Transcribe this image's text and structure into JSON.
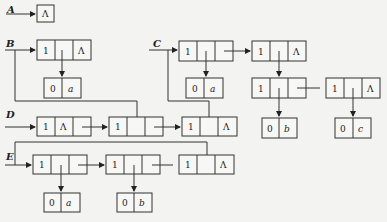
{
  "diagram": {
    "type": "generalized-list-linked-storage",
    "lists": [
      {
        "name": "A",
        "head": "Λ"
      },
      {
        "name": "B"
      },
      {
        "name": "C"
      },
      {
        "name": "D"
      },
      {
        "name": "E"
      }
    ],
    "null_symbol": "Λ",
    "tag_list": "1",
    "tag_atom": "0",
    "atoms": {
      "a": "a",
      "b": "b",
      "c": "c"
    }
  }
}
